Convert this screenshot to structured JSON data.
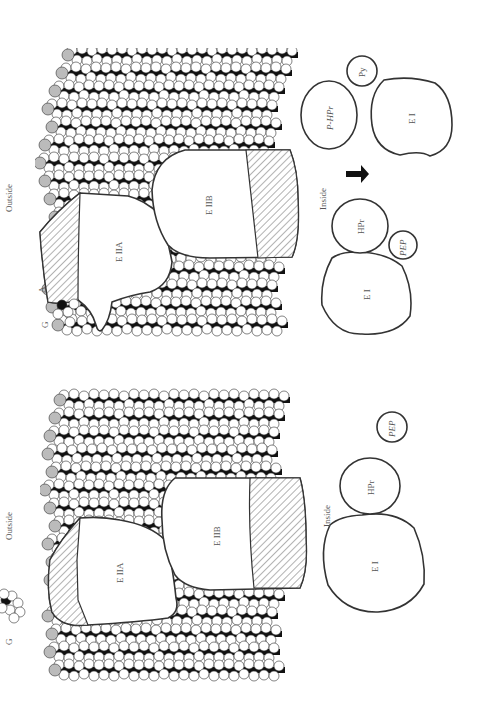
{
  "figure": {
    "orientation": "rotated 90deg counter-clockwise",
    "panels": [
      {
        "id": "panel-bottom",
        "labels": {
          "outside": "Outside",
          "inside": "Inside",
          "g": "G",
          "e2a": "E IIA",
          "e2b": "E IIB",
          "e1": "E I",
          "hpr": "HPr",
          "pep": "PEP"
        }
      },
      {
        "id": "panel-top",
        "labels": {
          "outside": "Outside",
          "inside": "Inside",
          "g": "G",
          "a": "A",
          "e2a": "E IIA",
          "e2b": "E IIB",
          "e1_left": "E I",
          "hpr": "HPr",
          "pep": "PEP",
          "p_hpr": "P-HPr",
          "py": "Py",
          "e1_right": "E I"
        }
      }
    ],
    "colors": {
      "line": "#333333",
      "lipid_tail": "#111111",
      "lipid_head": "#ffffff",
      "lipid_head_shaded": "#bbbbbb",
      "text": "#555555"
    }
  }
}
